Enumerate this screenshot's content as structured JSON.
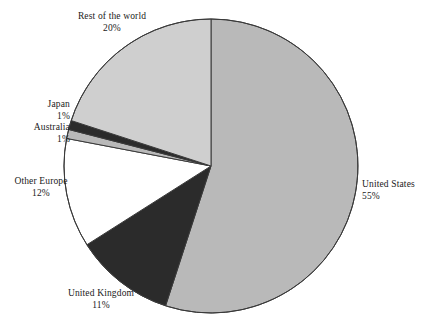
{
  "chart_data": {
    "type": "pie",
    "title": "",
    "subtitle": "",
    "xlabel": "",
    "ylabel": "",
    "legend_position": "none",
    "grid": false,
    "units": "percent",
    "start_angle_deg": 0,
    "direction": "clockwise",
    "total": 100,
    "categories": [
      "United States",
      "United Kingdom",
      "Other Europe",
      "Australia",
      "Japan",
      "Rest of the world"
    ],
    "values": [
      55,
      11,
      12,
      1,
      1,
      20
    ],
    "slices": [
      {
        "name": "United States",
        "value": 55,
        "value_label": "55%",
        "color": "#b9b9b9",
        "label_align": "left",
        "label_position": "right"
      },
      {
        "name": "United Kingdom",
        "value": 11,
        "value_label": "11%",
        "color": "#2b2b2b",
        "label_align": "center",
        "label_position": "bottom-left"
      },
      {
        "name": "Other Europe",
        "value": 12,
        "value_label": "12%",
        "color": "#ffffff",
        "label_align": "center",
        "label_position": "left"
      },
      {
        "name": "Australia",
        "value": 1,
        "value_label": "1%",
        "color": "#b9b9b9",
        "label_align": "center",
        "label_position": "upper-left"
      },
      {
        "name": "Japan",
        "value": 1,
        "value_label": "1%",
        "color": "#2b2b2b",
        "label_align": "center",
        "label_position": "upper-left"
      },
      {
        "name": "Rest of the world",
        "value": 20,
        "value_label": "20%",
        "color": "#cfcfcf",
        "label_align": "center",
        "label_position": "top"
      }
    ],
    "geometry": {
      "center_x": 211,
      "center_y": 166,
      "radius": 147
    },
    "style": {
      "outline_color": "#3a3a3a",
      "outline_width": 1,
      "background": "#ffffff"
    }
  }
}
